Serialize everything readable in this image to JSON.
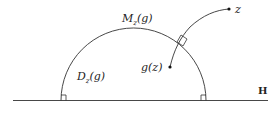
{
  "diagram": {
    "labels": {
      "geodesic": "M",
      "geodesic_sub": "z",
      "geodesic_arg": "(g)",
      "region": "D",
      "region_sub": "z",
      "region_arg": "(g)",
      "image_point": "g(z)",
      "point": "z",
      "space": "H"
    },
    "colors": {
      "stroke": "#333333",
      "text": "#222222",
      "background": "#ffffff"
    }
  }
}
